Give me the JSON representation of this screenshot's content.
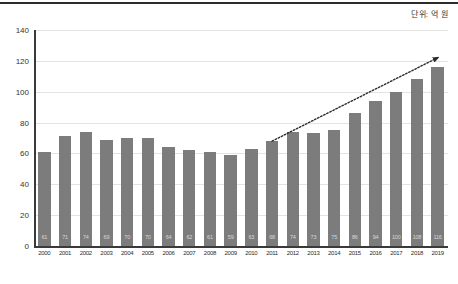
{
  "annotations": {
    "unit_note": "단위: 억 원"
  },
  "chart_data": {
    "type": "bar",
    "title": "",
    "subtitle": "",
    "xlabel": "",
    "ylabel": "",
    "ylim": [
      0,
      140
    ],
    "yticks": [
      0,
      20,
      40,
      60,
      80,
      100,
      120,
      140
    ],
    "grid": true,
    "legend": null,
    "bar_color": "#7c7c7c",
    "categories": [
      "2000",
      "2001",
      "2002",
      "2003",
      "2004",
      "2005",
      "2006",
      "2007",
      "2008",
      "2009",
      "2010",
      "2011",
      "2012",
      "2013",
      "2014",
      "2015",
      "2016",
      "2017",
      "2018",
      "2019"
    ],
    "values": [
      61,
      71,
      74,
      69,
      70,
      70,
      64,
      62,
      61,
      59,
      63,
      68,
      74,
      73,
      75,
      86,
      94,
      100,
      108,
      116
    ],
    "annotations": [
      {
        "type": "arrow",
        "style": "dotted",
        "from_category": "2011",
        "from_value": 68,
        "to_category": "2019",
        "to_value": 122,
        "color": "#2b2b2b"
      }
    ]
  }
}
